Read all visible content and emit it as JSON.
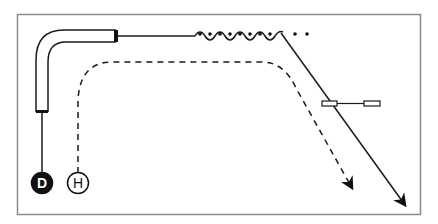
{
  "diagram": {
    "nodes": [
      {
        "id": "D",
        "label": "D",
        "style": "filled",
        "fill": "#111111",
        "text_color": "#ffffff"
      },
      {
        "id": "H",
        "label": "H",
        "style": "outline",
        "fill": "#ffffff",
        "text_color": "#111111"
      }
    ],
    "paths": [
      {
        "id": "solid-path",
        "from": "D",
        "style": "solid",
        "features": [
          "bent-pipe",
          "wavy-segment",
          "dots",
          "arrow-end"
        ]
      },
      {
        "id": "dashed-path",
        "from": "H",
        "style": "dashed",
        "features": [
          "arrow-end"
        ]
      }
    ],
    "colors": {
      "stroke": "#1a1a1a",
      "frame": "#888888",
      "background": "#ffffff"
    }
  }
}
